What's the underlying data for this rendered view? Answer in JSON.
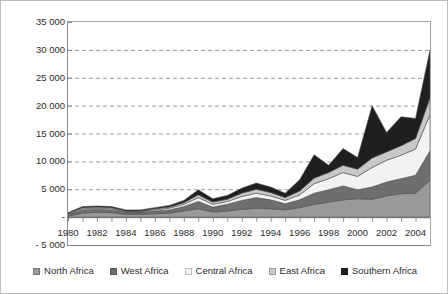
{
  "chart_data": {
    "type": "area",
    "stacked": true,
    "title": "",
    "subtitle": "",
    "xlabel": "",
    "ylabel": "",
    "grid": true,
    "grid_style": "dashed-horizontal",
    "legend_position": "bottom",
    "xlim": [
      1980,
      2005
    ],
    "ylim": [
      -5000,
      35000
    ],
    "ytick_step": 5000,
    "ytick_labels": [
      "35 000",
      "30 000",
      "25 000",
      "20 000",
      "15 000",
      "10 000",
      "5 000",
      "-",
      "- 5 000"
    ],
    "ytick_values": [
      35000,
      30000,
      25000,
      20000,
      15000,
      10000,
      5000,
      0,
      -5000
    ],
    "xtick_labels": [
      "1980",
      "1982",
      "1984",
      "1986",
      "1988",
      "1990",
      "1992",
      "1994",
      "1996",
      "1998",
      "2000",
      "2002",
      "2004"
    ],
    "xtick_values": [
      1980,
      1982,
      1984,
      1986,
      1988,
      1990,
      1992,
      1994,
      1996,
      1998,
      2000,
      2002,
      2004
    ],
    "x": [
      1980,
      1981,
      1982,
      1983,
      1984,
      1985,
      1986,
      1987,
      1988,
      1989,
      1990,
      1991,
      1992,
      1993,
      1994,
      1995,
      1996,
      1997,
      1998,
      1999,
      2000,
      2001,
      2002,
      2003,
      2004,
      2005
    ],
    "series": [
      {
        "name": "North Africa",
        "color": "#999999",
        "values": [
          200,
          700,
          900,
          800,
          500,
          500,
          600,
          700,
          1100,
          1500,
          900,
          1100,
          1400,
          1600,
          1500,
          1300,
          1700,
          2300,
          2700,
          3100,
          3300,
          3200,
          3800,
          4200,
          4300,
          6600
        ]
      },
      {
        "name": "West Africa",
        "color": "#6e6e6e",
        "values": [
          300,
          600,
          500,
          500,
          400,
          400,
          500,
          600,
          800,
          1300,
          900,
          1200,
          1600,
          1900,
          1600,
          1100,
          1400,
          2000,
          2200,
          2500,
          1600,
          2200,
          2500,
          2700,
          3200,
          5300
        ]
      },
      {
        "name": "Central Africa",
        "color": "#f2f2f2",
        "values": [
          100,
          200,
          200,
          200,
          100,
          100,
          200,
          300,
          400,
          700,
          500,
          500,
          700,
          800,
          700,
          600,
          900,
          1700,
          2000,
          2400,
          2400,
          3500,
          3900,
          4200,
          4700,
          6500
        ]
      },
      {
        "name": "East Africa",
        "color": "#c8c8c8",
        "values": [
          100,
          200,
          200,
          200,
          100,
          100,
          200,
          200,
          300,
          500,
          400,
          400,
          600,
          700,
          600,
          500,
          700,
          1000,
          1100,
          1300,
          1300,
          1700,
          1500,
          1700,
          1900,
          3000
        ]
      },
      {
        "name": "Southern Africa",
        "color": "#1f1f1f",
        "values": [
          100,
          200,
          200,
          200,
          200,
          200,
          200,
          300,
          400,
          900,
          600,
          700,
          900,
          1100,
          1000,
          800,
          2000,
          4200,
          1300,
          3000,
          2100,
          9400,
          3500,
          5200,
          3600,
          8600
        ]
      }
    ],
    "totals": [
      800,
      1900,
      2000,
      1900,
      1300,
      1300,
      1700,
      2100,
      3000,
      4900,
      3300,
      3900,
      5200,
      6100,
      5400,
      4300,
      6700,
      11200,
      9300,
      12300,
      10700,
      20000,
      15200,
      18000,
      17700,
      30000
    ]
  },
  "legend": {
    "items": [
      {
        "label": "North Africa",
        "color": "#999999"
      },
      {
        "label": "West Africa",
        "color": "#6e6e6e"
      },
      {
        "label": "Central Africa",
        "color": "#f2f2f2"
      },
      {
        "label": "East Africa",
        "color": "#c8c8c8"
      },
      {
        "label": "Southern Africa",
        "color": "#1f1f1f"
      }
    ]
  },
  "style": {
    "plot_background": "#ffffff",
    "axis_color": "#8a8a8a",
    "grid_color": "#9a9a9a",
    "frame_color": "#bdbdbd",
    "text_color": "#2b2b2b"
  }
}
